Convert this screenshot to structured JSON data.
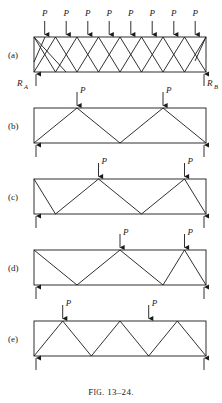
{
  "figure": {
    "caption_prefix": "F",
    "caption_smallcaps": "IG",
    "caption_rest": ". 13–24.",
    "caption_full": "Fig. 13-24.",
    "line_color": "#1a1a1a"
  },
  "labels": {
    "load": "P",
    "reaction_left": "R",
    "reaction_left_sub": "A",
    "reaction_right": "R",
    "reaction_right_sub": "B",
    "panel_a": "(a)",
    "panel_b": "(b)",
    "panel_c": "(c)",
    "panel_d": "(d)",
    "panel_e": "(e)"
  },
  "panels": [
    {
      "id": "a",
      "label": "(a)",
      "truss_type": "double-diagonal-lattice",
      "span_bays": 8,
      "loads": [
        {
          "label": "P",
          "x_fraction": 0.0625
        },
        {
          "label": "P",
          "x_fraction": 0.1875
        },
        {
          "label": "P",
          "x_fraction": 0.3125
        },
        {
          "label": "P",
          "x_fraction": 0.4375
        },
        {
          "label": "P",
          "x_fraction": 0.5625
        },
        {
          "label": "P",
          "x_fraction": 0.6875
        },
        {
          "label": "P",
          "x_fraction": 0.8125
        },
        {
          "label": "P",
          "x_fraction": 0.9375
        }
      ],
      "supports": [
        {
          "label": "R_A",
          "x_fraction": 0.0
        },
        {
          "label": "R_B",
          "x_fraction": 1.0
        }
      ]
    },
    {
      "id": "b",
      "label": "(b)",
      "truss_type": "warren",
      "span_bays": 4,
      "loads": [
        {
          "label": "P",
          "x_fraction": 0.25
        },
        {
          "label": "P",
          "x_fraction": 0.75
        }
      ],
      "supports": [
        {
          "label": "",
          "x_fraction": 0.0
        },
        {
          "label": "",
          "x_fraction": 1.0
        }
      ]
    },
    {
      "id": "c",
      "label": "(c)",
      "truss_type": "warren-offset",
      "span_bays": 4,
      "loads": [
        {
          "label": "P",
          "x_fraction": 0.375
        },
        {
          "label": "P",
          "x_fraction": 0.875
        }
      ],
      "supports": [
        {
          "label": "",
          "x_fraction": 0.0
        },
        {
          "label": "",
          "x_fraction": 1.0
        }
      ]
    },
    {
      "id": "d",
      "label": "(d)",
      "truss_type": "warren-offset",
      "span_bays": 4,
      "loads": [
        {
          "label": "P",
          "x_fraction": 0.5
        },
        {
          "label": "P",
          "x_fraction": 0.875
        }
      ],
      "supports": [
        {
          "label": "",
          "x_fraction": 0.0
        },
        {
          "label": "",
          "x_fraction": 1.0
        }
      ]
    },
    {
      "id": "e",
      "label": "(e)",
      "truss_type": "warren",
      "span_bays": 6,
      "loads": [
        {
          "label": "P",
          "x_fraction": 0.1667
        },
        {
          "label": "P",
          "x_fraction": 0.6667
        }
      ],
      "supports": [
        {
          "label": "",
          "x_fraction": 0.0
        },
        {
          "label": "",
          "x_fraction": 1.0
        }
      ]
    }
  ]
}
